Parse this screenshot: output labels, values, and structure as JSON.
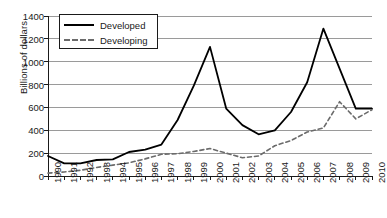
{
  "chart_data": {
    "type": "line",
    "title": "",
    "xlabel": "",
    "ylabel": "Billions of dollars",
    "ylim": [
      0,
      1400
    ],
    "ytick_step": 200,
    "yticks": [
      0,
      200,
      400,
      600,
      800,
      1000,
      1200,
      1400
    ],
    "grid": true,
    "legend_position": "top-left-inside",
    "x": [
      1990,
      1991,
      1992,
      1993,
      1994,
      1995,
      1996,
      1997,
      1998,
      1999,
      2000,
      2001,
      2002,
      2003,
      2004,
      2005,
      2006,
      2007,
      2008,
      2009,
      2010
    ],
    "categories": [
      "1990",
      "1991",
      "1992",
      "1993",
      "1994",
      "1995",
      "1996",
      "1997",
      "1998",
      "1999",
      "2000",
      "2001",
      "2002",
      "2003",
      "2004",
      "2005",
      "2006",
      "2007",
      "2008",
      "2009",
      "2010"
    ],
    "series": [
      {
        "name": "Developed",
        "style": "solid",
        "color": "#000000",
        "values": [
          175,
          110,
          110,
          140,
          145,
          210,
          230,
          275,
          490,
          790,
          1130,
          590,
          445,
          365,
          400,
          560,
          820,
          1290,
          940,
          590,
          590
        ]
      },
      {
        "name": "Developing",
        "style": "dashed",
        "color": "#6b6b6b",
        "values": [
          25,
          35,
          50,
          75,
          95,
          115,
          150,
          190,
          195,
          215,
          240,
          200,
          160,
          175,
          265,
          310,
          385,
          420,
          650,
          500,
          580
        ]
      }
    ]
  },
  "axis": {
    "y_title": "Billions of dollars"
  },
  "legend": {
    "items": [
      {
        "label": "Developed"
      },
      {
        "label": "Developing"
      }
    ]
  },
  "footer": {
    "smudge": ""
  }
}
